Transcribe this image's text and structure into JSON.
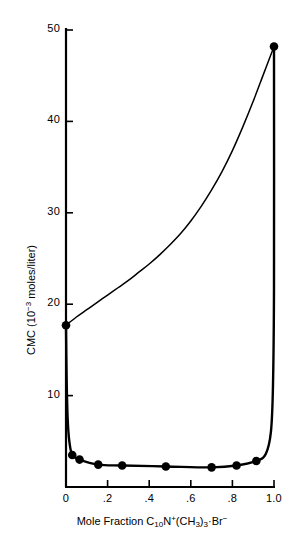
{
  "figure": {
    "background_color": "#ffffff",
    "ink_color": "#000000"
  },
  "chart_data": {
    "type": "line",
    "title": "",
    "subtitle": "",
    "xlabel": "Mole Fraction C10N+(CH3)3·Br−",
    "xlabel_parts": {
      "prefix": "Mole Fraction C",
      "sub1": "10",
      "mid1": "N",
      "sup1": "+",
      "mid2": "(CH",
      "sub2": "3",
      "mid3": ")",
      "sub3": "3",
      "mid4": "·Br",
      "sup2": "−"
    },
    "ylabel": "CMC (10−3 moles/liter)",
    "ylabel_parts": {
      "prefix": "CMC (10",
      "sup": "−3",
      "suffix": " moles/liter)"
    },
    "xlim": [
      0,
      1.0
    ],
    "ylim": [
      0,
      50
    ],
    "grid": false,
    "legend": "none",
    "x_ticks": [
      {
        "value": 0,
        "label": "0"
      },
      {
        "value": 0.2,
        "label": ".2"
      },
      {
        "value": 0.4,
        "label": ".4"
      },
      {
        "value": 0.6,
        "label": ".6"
      },
      {
        "value": 0.8,
        "label": ".8"
      },
      {
        "value": 1.0,
        "label": "1.0"
      }
    ],
    "y_ticks": [
      {
        "value": 10,
        "label": "10"
      },
      {
        "value": 20,
        "label": "20"
      },
      {
        "value": 30,
        "label": "30"
      },
      {
        "value": 40,
        "label": "40"
      },
      {
        "value": 50,
        "label": "50"
      }
    ],
    "series": [
      {
        "name": "upper-curve",
        "style": "solid-thin",
        "markers": true,
        "points": [
          {
            "x": 0.0,
            "y": 17.7,
            "marker": true
          },
          {
            "x": 0.05,
            "y": 18.6,
            "marker": false
          },
          {
            "x": 0.1,
            "y": 19.4,
            "marker": false
          },
          {
            "x": 0.15,
            "y": 20.2,
            "marker": false
          },
          {
            "x": 0.2,
            "y": 21.0,
            "marker": false
          },
          {
            "x": 0.25,
            "y": 21.8,
            "marker": false
          },
          {
            "x": 0.3,
            "y": 22.6,
            "marker": false
          },
          {
            "x": 0.35,
            "y": 23.5,
            "marker": false
          },
          {
            "x": 0.4,
            "y": 24.4,
            "marker": false
          },
          {
            "x": 0.45,
            "y": 25.4,
            "marker": false
          },
          {
            "x": 0.5,
            "y": 26.5,
            "marker": false
          },
          {
            "x": 0.55,
            "y": 27.7,
            "marker": false
          },
          {
            "x": 0.6,
            "y": 29.1,
            "marker": false
          },
          {
            "x": 0.65,
            "y": 30.7,
            "marker": false
          },
          {
            "x": 0.7,
            "y": 32.5,
            "marker": false
          },
          {
            "x": 0.75,
            "y": 34.5,
            "marker": false
          },
          {
            "x": 0.8,
            "y": 36.8,
            "marker": false
          },
          {
            "x": 0.85,
            "y": 39.4,
            "marker": false
          },
          {
            "x": 0.9,
            "y": 42.2,
            "marker": false
          },
          {
            "x": 0.95,
            "y": 45.2,
            "marker": false
          },
          {
            "x": 1.0,
            "y": 48.2,
            "marker": true
          }
        ]
      },
      {
        "name": "lower-curve",
        "style": "solid-thick",
        "markers": true,
        "points": [
          {
            "x": 0.0,
            "y": 17.7,
            "marker": false
          },
          {
            "x": 0.003,
            "y": 12.0,
            "marker": false
          },
          {
            "x": 0.008,
            "y": 7.5,
            "marker": false
          },
          {
            "x": 0.016,
            "y": 5.0,
            "marker": false
          },
          {
            "x": 0.03,
            "y": 3.5,
            "marker": true
          },
          {
            "x": 0.065,
            "y": 3.0,
            "marker": true
          },
          {
            "x": 0.155,
            "y": 2.45,
            "marker": true
          },
          {
            "x": 0.27,
            "y": 2.35,
            "marker": true
          },
          {
            "x": 0.48,
            "y": 2.25,
            "marker": true
          },
          {
            "x": 0.7,
            "y": 2.15,
            "marker": true
          },
          {
            "x": 0.82,
            "y": 2.35,
            "marker": true
          },
          {
            "x": 0.915,
            "y": 2.85,
            "marker": true
          },
          {
            "x": 0.96,
            "y": 3.6,
            "marker": false
          },
          {
            "x": 0.985,
            "y": 6.0,
            "marker": false
          },
          {
            "x": 0.995,
            "y": 11.0,
            "marker": false
          },
          {
            "x": 1.0,
            "y": 22.0,
            "marker": false
          },
          {
            "x": 1.0,
            "y": 48.2,
            "marker": false
          }
        ]
      }
    ],
    "marker_points": [
      {
        "x": 0.0,
        "y": 17.7
      },
      {
        "x": 1.0,
        "y": 48.2
      },
      {
        "x": 0.03,
        "y": 3.5
      },
      {
        "x": 0.065,
        "y": 3.0
      },
      {
        "x": 0.155,
        "y": 2.45
      },
      {
        "x": 0.27,
        "y": 2.35
      },
      {
        "x": 0.48,
        "y": 2.25
      },
      {
        "x": 0.7,
        "y": 2.15
      },
      {
        "x": 0.82,
        "y": 2.35
      },
      {
        "x": 0.915,
        "y": 2.85
      }
    ]
  }
}
